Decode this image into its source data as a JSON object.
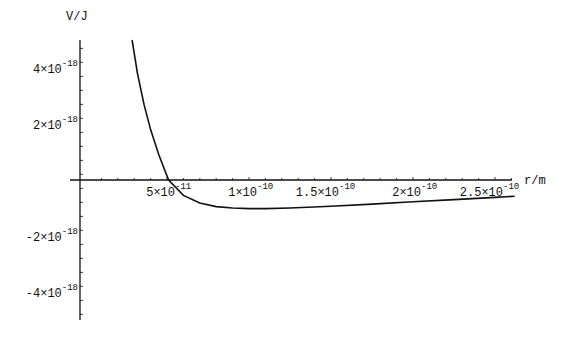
{
  "chart_data": {
    "type": "line",
    "title": "",
    "xlabel": "r/m",
    "ylabel": "V/J",
    "xlim": [
      0,
      2.65e-10
    ],
    "ylim": [
      -5e-18,
      5e-18
    ],
    "grid": false,
    "legend": null,
    "x_ticks": [
      {
        "value": 5e-11,
        "mant": "5×10",
        "exp": "-11"
      },
      {
        "value": 1e-10,
        "mant": "1×10",
        "exp": "-10"
      },
      {
        "value": 1.5e-10,
        "mant": "1.5×10",
        "exp": "-10"
      },
      {
        "value": 2e-10,
        "mant": "2×10",
        "exp": "-10"
      },
      {
        "value": 2.5e-10,
        "mant": "2.5×10",
        "exp": "-10"
      }
    ],
    "y_ticks": [
      {
        "value": 4e-18,
        "mant": "4×10",
        "exp": "-18"
      },
      {
        "value": 2e-18,
        "mant": "2×10",
        "exp": "-18"
      },
      {
        "value": -2e-18,
        "mant": "-2×10",
        "exp": "-18"
      },
      {
        "value": -4e-18,
        "mant": "-4×10",
        "exp": "-18"
      }
    ],
    "series": [
      {
        "name": "V(r)",
        "x": [
          2.87e-11,
          3.2e-11,
          3.6e-11,
          4e-11,
          4.5e-11,
          5.1e-11,
          6e-11,
          7e-11,
          8e-11,
          9e-11,
          1e-10,
          1.1e-10,
          1.25e-10,
          1.5e-10,
          1.75e-10,
          2e-10,
          2.25e-10,
          2.5e-10,
          2.62e-10
        ],
        "y": [
          5e-18,
          3.8e-18,
          2.7e-18,
          1.8e-18,
          9e-19,
          0.0,
          -5.5e-19,
          -8.2e-19,
          -9.5e-19,
          -1e-18,
          -1.02e-18,
          -1.02e-18,
          -1e-18,
          -9.4e-19,
          -8.6e-19,
          -7.8e-19,
          -7e-19,
          -6.2e-19,
          -5.8e-19
        ]
      }
    ]
  }
}
